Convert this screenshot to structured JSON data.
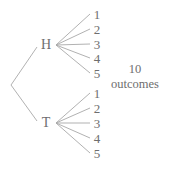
{
  "diagram": {
    "type": "tree",
    "line_color": "#a8a8a8",
    "text_color": "#6e6e6e",
    "root": {
      "x": 11,
      "y": 85
    },
    "first_level": [
      {
        "label": "H",
        "x": 46,
        "y": 45,
        "line_end": {
          "x": 37,
          "y": 47
        },
        "branch_origin": {
          "x": 56,
          "y": 45
        },
        "children": [
          {
            "label": "1",
            "y": 14
          },
          {
            "label": "2",
            "y": 29
          },
          {
            "label": "3",
            "y": 44
          },
          {
            "label": "4",
            "y": 58
          },
          {
            "label": "5",
            "y": 73
          }
        ]
      },
      {
        "label": "T",
        "x": 46,
        "y": 123,
        "line_end": {
          "x": 37,
          "y": 121
        },
        "branch_origin": {
          "x": 56,
          "y": 123
        },
        "children": [
          {
            "label": "1",
            "y": 93
          },
          {
            "label": "2",
            "y": 108
          },
          {
            "label": "3",
            "y": 123
          },
          {
            "label": "4",
            "y": 138
          },
          {
            "label": "5",
            "y": 153
          }
        ]
      }
    ],
    "leaf_x": 97,
    "branch_end_x": 90,
    "summary": {
      "count": "10",
      "label": "outcomes"
    }
  }
}
